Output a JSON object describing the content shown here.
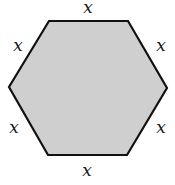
{
  "diagram": {
    "shape": "regular hexagon",
    "fill_color": "#cfcfcf",
    "stroke_color": "#111111",
    "stroke_width": 2.2,
    "vertices": [
      [
        49,
        21
      ],
      [
        128,
        21
      ],
      [
        167,
        88
      ],
      [
        127,
        155
      ],
      [
        48,
        155
      ],
      [
        9,
        87
      ]
    ],
    "labels": {
      "top": "x",
      "upper_right": "x",
      "lower_right": "x",
      "bottom": "x",
      "lower_left": "x",
      "upper_left": "x"
    }
  }
}
